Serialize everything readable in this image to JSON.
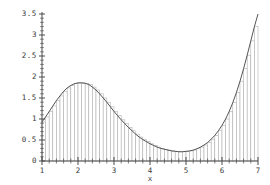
{
  "chart_data": {
    "type": "area",
    "title": "",
    "subtitle": "",
    "xlabel": "x",
    "ylabel": "",
    "grid": false,
    "legend": "none",
    "xlim": [
      1,
      7
    ],
    "ylim": [
      0,
      3.5
    ],
    "x_ticks": [
      1,
      2,
      3,
      4,
      5,
      6,
      7
    ],
    "x_tick_labels": [
      "1",
      "2",
      "3",
      "4",
      "5",
      "6",
      "7"
    ],
    "x_minor_tick_step": 0.2,
    "y_ticks": [
      0,
      0.5,
      1,
      1.5,
      2,
      2.5,
      3,
      3.5
    ],
    "y_tick_labels": [
      "0",
      "0.5",
      "1",
      "1.5",
      "2",
      "2.5",
      "3",
      "3.5"
    ],
    "y_minor_tick_step": 0.1,
    "annotations": [],
    "series": [
      {
        "name": "curve",
        "type": "line",
        "color": "#555555",
        "x": [
          1.0,
          1.1,
          1.2,
          1.3,
          1.4,
          1.5,
          1.6,
          1.7,
          1.8,
          1.9,
          2.0,
          2.1,
          2.2,
          2.3,
          2.4,
          2.5,
          2.6,
          2.7,
          2.8,
          2.9,
          3.0,
          3.1,
          3.2,
          3.3,
          3.4,
          3.5,
          3.6,
          3.7,
          3.8,
          3.9,
          4.0,
          4.1,
          4.2,
          4.3,
          4.4,
          4.5,
          4.6,
          4.7,
          4.8,
          4.9,
          5.0,
          5.1,
          5.2,
          5.3,
          5.4,
          5.5,
          5.6,
          5.7,
          5.8,
          5.9,
          6.0,
          6.1,
          6.2,
          6.3,
          6.4,
          6.5,
          6.6,
          6.7,
          6.8,
          6.9,
          7.0
        ],
        "y": [
          0.93,
          1.05,
          1.18,
          1.31,
          1.44,
          1.55,
          1.66,
          1.74,
          1.8,
          1.84,
          1.86,
          1.86,
          1.85,
          1.82,
          1.76,
          1.69,
          1.6,
          1.5,
          1.4,
          1.29,
          1.18,
          1.08,
          0.98,
          0.89,
          0.8,
          0.72,
          0.64,
          0.57,
          0.51,
          0.46,
          0.41,
          0.37,
          0.33,
          0.3,
          0.28,
          0.26,
          0.24,
          0.23,
          0.22,
          0.22,
          0.23,
          0.24,
          0.26,
          0.29,
          0.33,
          0.38,
          0.44,
          0.52,
          0.61,
          0.72,
          0.85,
          1.0,
          1.18,
          1.39,
          1.63,
          1.9,
          2.2,
          2.52,
          2.86,
          3.2,
          3.5
        ]
      },
      {
        "name": "riemann-rectangles",
        "type": "bar",
        "edge_color": "#aaaaaa",
        "fill_color": "#ffffff",
        "bar_count": 60,
        "bar_width": 0.1,
        "x_left": [
          1.0,
          1.1,
          1.2,
          1.3,
          1.4,
          1.5,
          1.6,
          1.7,
          1.8,
          1.9,
          2.0,
          2.1,
          2.2,
          2.3,
          2.4,
          2.5,
          2.6,
          2.7,
          2.8,
          2.9,
          3.0,
          3.1,
          3.2,
          3.3,
          3.4,
          3.5,
          3.6,
          3.7,
          3.8,
          3.9,
          4.0,
          4.1,
          4.2,
          4.3,
          4.4,
          4.5,
          4.6,
          4.7,
          4.8,
          4.9,
          5.0,
          5.1,
          5.2,
          5.3,
          5.4,
          5.5,
          5.6,
          5.7,
          5.8,
          5.9,
          6.0,
          6.1,
          6.2,
          6.3,
          6.4,
          6.5,
          6.6,
          6.7,
          6.8,
          6.9
        ],
        "heights": [
          0.93,
          1.05,
          1.18,
          1.31,
          1.44,
          1.55,
          1.66,
          1.74,
          1.8,
          1.84,
          1.86,
          1.86,
          1.85,
          1.82,
          1.76,
          1.69,
          1.6,
          1.5,
          1.4,
          1.29,
          1.18,
          1.08,
          0.98,
          0.89,
          0.8,
          0.72,
          0.64,
          0.57,
          0.51,
          0.46,
          0.41,
          0.37,
          0.33,
          0.3,
          0.28,
          0.26,
          0.24,
          0.23,
          0.22,
          0.22,
          0.23,
          0.24,
          0.26,
          0.29,
          0.33,
          0.38,
          0.44,
          0.52,
          0.61,
          0.72,
          0.85,
          1.0,
          1.18,
          1.39,
          1.63,
          1.9,
          2.2,
          2.52,
          2.86,
          3.2
        ]
      }
    ]
  }
}
